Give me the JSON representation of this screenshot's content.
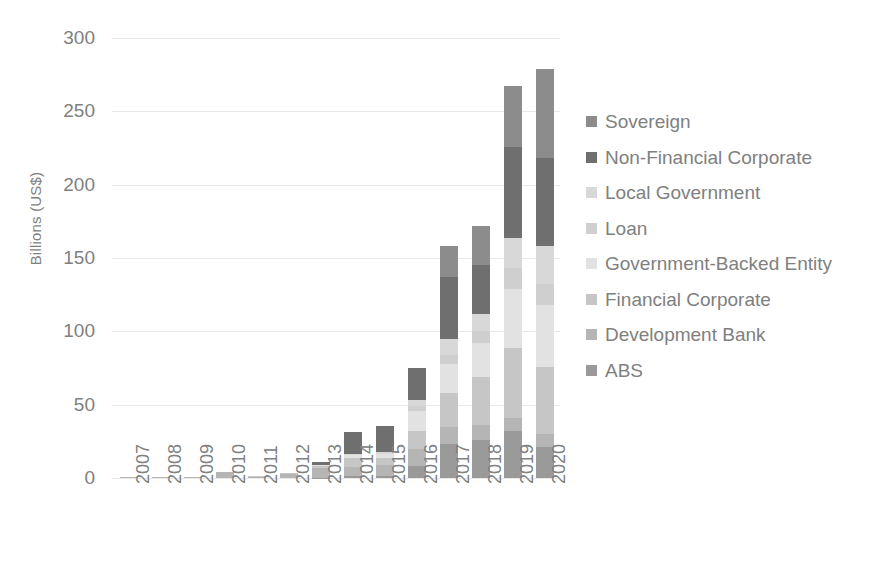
{
  "chart_data": {
    "type": "bar",
    "stacked": true,
    "title": "",
    "xlabel": "",
    "ylabel": "Billions (US$)",
    "ylim": [
      0,
      300
    ],
    "ytick_labels": [
      "300",
      "250",
      "200",
      "150",
      "100",
      "50",
      "0"
    ],
    "ytick_values": [
      300,
      250,
      200,
      150,
      100,
      50,
      0
    ],
    "grid": true,
    "legend_position": "right",
    "categories": [
      "2007",
      "2008",
      "2009",
      "2010",
      "2011",
      "2012",
      "2013",
      "2014",
      "2015",
      "2016",
      "2017",
      "2018",
      "2019",
      "2020"
    ],
    "series": [
      {
        "name": "ABS",
        "color": "#9a9a9a",
        "values": [
          0,
          0,
          0,
          0,
          0,
          0,
          0.3,
          1.5,
          1.5,
          8,
          23,
          26,
          32,
          21
        ]
      },
      {
        "name": "Development Bank",
        "color": "#b5b5b5",
        "values": [
          0.8,
          0.4,
          0.9,
          3.8,
          1.0,
          2.6,
          6.5,
          6.0,
          7.5,
          12,
          12,
          10,
          9,
          9
        ]
      },
      {
        "name": "Financial Corporate",
        "color": "#c6c6c6",
        "values": [
          0,
          0,
          0,
          0.2,
          0.1,
          0.5,
          1.5,
          6.0,
          4.5,
          12,
          23,
          33,
          48,
          46
        ]
      },
      {
        "name": "Government-Backed Entity",
        "color": "#e2e2e2",
        "values": [
          0,
          0,
          0,
          0,
          0,
          0,
          0.5,
          2.5,
          3.0,
          14,
          20,
          23,
          40,
          42
        ]
      },
      {
        "name": "Loan",
        "color": "#cfcfcf",
        "values": [
          0,
          0,
          0,
          0,
          0,
          0,
          0,
          0,
          0,
          3,
          6,
          8,
          14,
          14
        ]
      },
      {
        "name": "Local Government",
        "color": "#d8d8d8",
        "values": [
          0,
          0,
          0,
          0,
          0,
          0,
          0,
          0.5,
          1.0,
          4,
          11,
          12,
          21,
          26
        ]
      },
      {
        "name": "Non-Financial Corporate",
        "color": "#6f6f6f",
        "values": [
          0,
          0,
          0,
          0,
          0,
          0,
          2.0,
          15,
          18,
          22,
          42,
          33,
          62,
          60
        ]
      },
      {
        "name": "Sovereign",
        "color": "#8c8c8c",
        "values": [
          0,
          0,
          0,
          0,
          0,
          0,
          0,
          0,
          0,
          0,
          21,
          27,
          41,
          61
        ]
      }
    ],
    "totals": [
      0.8,
      0.4,
      0.9,
      4.0,
      1.1,
      3.1,
      10.8,
      31.5,
      35.5,
      75,
      158,
      172,
      267,
      279
    ]
  },
  "legend": {
    "items": [
      {
        "label": "Sovereign",
        "color": "#8c8c8c"
      },
      {
        "label": "Non-Financial Corporate",
        "color": "#6f6f6f"
      },
      {
        "label": "Local Government",
        "color": "#d8d8d8"
      },
      {
        "label": "Loan",
        "color": "#cfcfcf"
      },
      {
        "label": "Government-Backed Entity",
        "color": "#e2e2e2"
      },
      {
        "label": "Financial Corporate",
        "color": "#c6c6c6"
      },
      {
        "label": "Development Bank",
        "color": "#b5b5b5"
      },
      {
        "label": "ABS",
        "color": "#9a9a9a"
      }
    ]
  },
  "axis": {
    "y_title": "Billions (US$)"
  },
  "colors": {
    "gridline": "#e8e8e8",
    "text": "#808080",
    "background": "#ffffff"
  }
}
